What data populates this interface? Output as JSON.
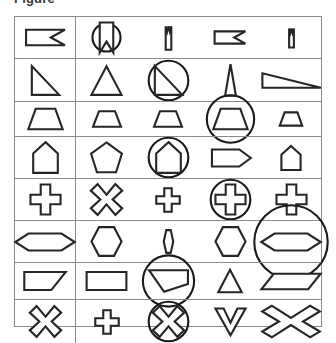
{
  "caption": {
    "text": "Figure"
  },
  "figure": {
    "type": "shape-grid",
    "rows": 8,
    "columns": 5,
    "stroke_color": "#262626",
    "grid_line_color": "#8a8a8a",
    "background_color": "#ffffff",
    "column_divider_after": 1,
    "cells": [
      {
        "row": 1,
        "col": 1,
        "shape": "flag-pennant-notched-right",
        "circled": false,
        "size": "medium",
        "label": "flag with right V notch"
      },
      {
        "row": 1,
        "col": 2,
        "shape": "banner-notched-bottom",
        "circled": true,
        "size": "medium",
        "label": "banner with bottom V notch in circle"
      },
      {
        "row": 1,
        "col": 3,
        "shape": "banner-notched-top-narrow",
        "circled": false,
        "size": "small",
        "label": "narrow banner with top V notch"
      },
      {
        "row": 1,
        "col": 4,
        "shape": "flag-pennant-notched-right",
        "circled": false,
        "size": "small",
        "label": "flag with right V notch"
      },
      {
        "row": 1,
        "col": 5,
        "shape": "banner-notched-top-narrow",
        "circled": false,
        "size": "tiny",
        "label": "narrow banner with top V notch"
      },
      {
        "row": 2,
        "col": 1,
        "shape": "right-triangle",
        "circled": false,
        "size": "medium",
        "label": "right triangle"
      },
      {
        "row": 2,
        "col": 2,
        "shape": "triangle",
        "circled": false,
        "size": "medium",
        "label": "triangle"
      },
      {
        "row": 2,
        "col": 3,
        "shape": "right-triangle",
        "circled": true,
        "size": "medium",
        "label": "right triangle in circle"
      },
      {
        "row": 2,
        "col": 4,
        "shape": "triangle-narrow",
        "circled": false,
        "size": "medium",
        "label": "narrow triangle"
      },
      {
        "row": 2,
        "col": 5,
        "shape": "right-triangle-flat",
        "circled": false,
        "size": "wide",
        "label": "flat right triangle"
      },
      {
        "row": 3,
        "col": 1,
        "shape": "trapezoid",
        "circled": false,
        "size": "medium",
        "label": "trapezoid"
      },
      {
        "row": 3,
        "col": 2,
        "shape": "trapezoid",
        "circled": false,
        "size": "small",
        "label": "trapezoid"
      },
      {
        "row": 3,
        "col": 3,
        "shape": "trapezoid",
        "circled": false,
        "size": "small",
        "label": "trapezoid"
      },
      {
        "row": 3,
        "col": 4,
        "shape": "trapezoid",
        "circled": true,
        "size": "medium",
        "label": "trapezoid in circle"
      },
      {
        "row": 3,
        "col": 5,
        "shape": "trapezoid",
        "circled": false,
        "size": "tiny",
        "label": "trapezoid"
      },
      {
        "row": 4,
        "col": 1,
        "shape": "pentagon-tall",
        "circled": false,
        "size": "medium",
        "label": "tall pentagon"
      },
      {
        "row": 4,
        "col": 2,
        "shape": "pentagon",
        "circled": false,
        "size": "medium",
        "label": "pentagon"
      },
      {
        "row": 4,
        "col": 3,
        "shape": "pentagon-tall",
        "circled": true,
        "size": "medium",
        "label": "tall pentagon in circle"
      },
      {
        "row": 4,
        "col": 4,
        "shape": "pentagon-right",
        "circled": false,
        "size": "medium",
        "label": "pentagon pointing right"
      },
      {
        "row": 4,
        "col": 5,
        "shape": "pentagon-tall",
        "circled": false,
        "size": "small",
        "label": "tall pentagon"
      },
      {
        "row": 5,
        "col": 1,
        "shape": "cross",
        "circled": false,
        "size": "medium",
        "label": "cross"
      },
      {
        "row": 5,
        "col": 2,
        "shape": "x-cross",
        "circled": false,
        "size": "medium",
        "label": "X cross"
      },
      {
        "row": 5,
        "col": 3,
        "shape": "cross",
        "circled": false,
        "size": "small",
        "label": "cross"
      },
      {
        "row": 5,
        "col": 4,
        "shape": "cross",
        "circled": true,
        "size": "medium",
        "label": "cross in circle"
      },
      {
        "row": 5,
        "col": 5,
        "shape": "cross",
        "circled": false,
        "size": "medium",
        "label": "cross"
      },
      {
        "row": 6,
        "col": 1,
        "shape": "hexagon-wide",
        "circled": false,
        "size": "wide",
        "label": "wide hexagon"
      },
      {
        "row": 6,
        "col": 2,
        "shape": "hexagon",
        "circled": false,
        "size": "medium",
        "label": "hexagon"
      },
      {
        "row": 6,
        "col": 3,
        "shape": "hexagon-narrow",
        "circled": false,
        "size": "small",
        "label": "narrow hexagon"
      },
      {
        "row": 6,
        "col": 4,
        "shape": "hexagon",
        "circled": false,
        "size": "medium",
        "label": "hexagon"
      },
      {
        "row": 6,
        "col": 5,
        "shape": "hexagon-wide",
        "circled": true,
        "size": "wide",
        "label": "wide hexagon in circle"
      },
      {
        "row": 7,
        "col": 1,
        "shape": "parallelogram",
        "circled": false,
        "size": "medium",
        "label": "parallelogram"
      },
      {
        "row": 7,
        "col": 2,
        "shape": "rectangle",
        "circled": false,
        "size": "medium",
        "label": "rectangle"
      },
      {
        "row": 7,
        "col": 3,
        "shape": "right-trapezoid",
        "circled": true,
        "size": "medium",
        "label": "right trapezoid in circle"
      },
      {
        "row": 7,
        "col": 4,
        "shape": "triangle",
        "circled": false,
        "size": "small",
        "label": "triangle"
      },
      {
        "row": 7,
        "col": 5,
        "shape": "parallelogram-flat",
        "circled": false,
        "size": "wide",
        "label": "flat parallelogram"
      },
      {
        "row": 8,
        "col": 1,
        "shape": "x-cross",
        "circled": false,
        "size": "medium",
        "label": "X cross"
      },
      {
        "row": 8,
        "col": 2,
        "shape": "cross",
        "circled": false,
        "size": "small",
        "label": "cross"
      },
      {
        "row": 8,
        "col": 3,
        "shape": "x-cross",
        "circled": true,
        "size": "medium",
        "label": "X cross in circle"
      },
      {
        "row": 8,
        "col": 4,
        "shape": "chevron-down",
        "circled": false,
        "size": "medium",
        "label": "downward chevron"
      },
      {
        "row": 8,
        "col": 5,
        "shape": "x-cross-wide",
        "circled": false,
        "size": "wide",
        "label": "wide X cross"
      }
    ]
  }
}
